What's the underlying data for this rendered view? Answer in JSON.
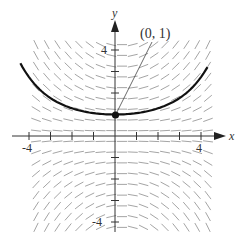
{
  "figure": {
    "type": "slope-field",
    "axes": {
      "x_label": "x",
      "y_label": "y",
      "x_range": [
        -4.5,
        4.5
      ],
      "y_range": [
        -4.5,
        4.5
      ],
      "x_tick_labels": [
        "-4",
        "4"
      ],
      "y_tick_labels": [
        "4",
        "-4"
      ],
      "tick_step": 1
    },
    "point": {
      "label": "(0, 1)",
      "x": 0,
      "y": 1
    },
    "curve": {
      "description": "solution curve through (0, 1)",
      "color": "#111111"
    },
    "slope_field": {
      "color": "#9a9a9a",
      "rule": "slope proportional to x*y"
    },
    "colors": {
      "axis": "#333333",
      "curve": "#111111",
      "segments": "#9a9a9a",
      "point": "#111111"
    }
  }
}
